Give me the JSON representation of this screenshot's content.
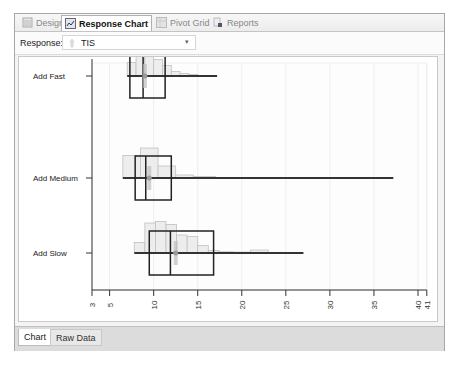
{
  "tabs": [
    {
      "label": "Design",
      "icon": "design-icon",
      "active": false
    },
    {
      "label": "Response Chart",
      "icon": "chart-icon",
      "active": true
    },
    {
      "label": "Pivot Grid",
      "icon": "grid-icon",
      "active": false
    },
    {
      "label": "Reports",
      "icon": "reports-icon",
      "active": false
    }
  ],
  "toolbar": {
    "response_label": "Response:",
    "response_value": "TIS",
    "response_icon": "variable-icon"
  },
  "bottom_tabs": [
    {
      "label": "Chart",
      "active": true
    },
    {
      "label": "Raw Data",
      "active": false
    }
  ],
  "colors": {
    "box_stroke": "#222222",
    "hist_fill": "#ededed",
    "hist_stroke": "#c0c0c0",
    "whisker": "#333333",
    "grid": "#eeeeee"
  },
  "chart_data": {
    "type": "box_histogram",
    "title": "",
    "xlabel": "",
    "ylabel": "",
    "orientation": "horizontal",
    "xlim": [
      3,
      41
    ],
    "x_ticks": [
      3,
      5,
      10,
      15,
      20,
      25,
      30,
      35,
      40,
      41
    ],
    "grid": true,
    "categories": [
      "Add Fast",
      "Add Medium",
      "Add Slow"
    ],
    "series": [
      {
        "name": "Add Fast",
        "min": 7,
        "q1": 7.3,
        "median": 8.8,
        "q3": 11.3,
        "max": 17.2,
        "mean": 9.0,
        "histogram": {
          "bin_edges": [
            7,
            8,
            9,
            10,
            11,
            12,
            13,
            14,
            15
          ],
          "heights": [
            0.45,
            1.0,
            0.75,
            0.55,
            0.35,
            0.15,
            0.08,
            0.05
          ]
        }
      },
      {
        "name": "Add Medium",
        "min": 6.5,
        "q1": 7.9,
        "median": 9.1,
        "q3": 12.0,
        "max": 37.2,
        "mean": 9.5,
        "histogram": {
          "bin_edges": [
            6.5,
            8.5,
            10.5,
            12.5,
            14.5,
            17
          ],
          "heights": [
            0.75,
            1.0,
            0.4,
            0.1,
            0.05
          ]
        }
      },
      {
        "name": "Add Slow",
        "min": 7.8,
        "q1": 9.5,
        "median": 11.9,
        "q3": 16.8,
        "max": 27.0,
        "mean": 12.5,
        "histogram": {
          "bin_edges": [
            7.8,
            9,
            10.2,
            11.4,
            12.6,
            13.8,
            15,
            16.2,
            17.4,
            19,
            21,
            23
          ],
          "heights": [
            0.35,
            1.0,
            1.05,
            0.95,
            0.6,
            0.55,
            0.25,
            0.08,
            0.04,
            0.03,
            0.1
          ]
        }
      }
    ]
  }
}
